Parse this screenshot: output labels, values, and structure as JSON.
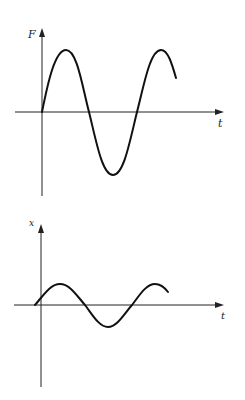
{
  "figure": {
    "top_graph": {
      "y_label": "F",
      "x_label": "t",
      "description": "Driving force F versus time t: sinusoid starting at origin with larger amplitude"
    },
    "bottom_graph": {
      "y_label": "x",
      "x_label": "t",
      "description": "Displacement x versus time t: smaller-amplitude sinusoid, phase-shifted (starts slightly before origin)"
    }
  },
  "colors": {
    "background": "#ffffff",
    "ink": "#111111"
  }
}
